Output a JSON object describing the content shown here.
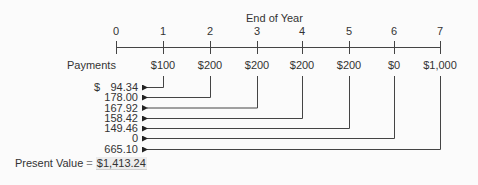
{
  "title": "End of Year",
  "years": [
    "0",
    "1",
    "2",
    "3",
    "4",
    "5",
    "6",
    "7"
  ],
  "payments_label": "Payments",
  "payments": [
    "",
    "$100",
    "$200",
    "$200",
    "$200",
    "$200",
    "$0",
    "$1,000"
  ],
  "present_values": {
    "currency": "$",
    "rows": [
      "94.34",
      "178.00",
      "167.92",
      "158.42",
      "149.46",
      "0",
      "665.10"
    ]
  },
  "total": {
    "label": "Present Value",
    "equals": "=",
    "value": "$1,413.24"
  }
}
